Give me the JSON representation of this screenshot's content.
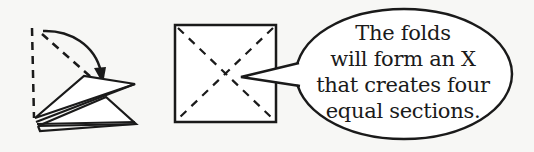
{
  "diagram": {
    "step_fold": {
      "description": "triangle being folded over along the diagonal dashed line, with a curved arrow showing the fold direction"
    },
    "step_square": {
      "description": "unfolded square showing dashed crease lines forming an X"
    },
    "speech_bubble": {
      "lines": [
        "The folds",
        "will form an X",
        "that creates four",
        "equal sections."
      ]
    },
    "colors": {
      "background": "#f7f7f5",
      "ink": "#1a1a1a",
      "paper": "#ffffff"
    }
  }
}
